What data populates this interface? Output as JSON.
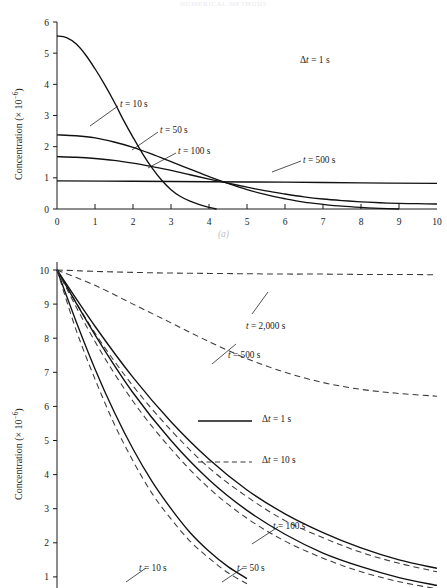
{
  "page": {
    "running_head": "NUMERICAL METHODS"
  },
  "figure": {
    "panel_a_caption": "(a)",
    "panel_b_caption": "(b)"
  },
  "chart_data": [
    {
      "id": "panel-a",
      "type": "line",
      "title": "",
      "xlabel": "",
      "ylabel": "Concentration (× 10",
      "ylabel_exponent": "−6",
      "ylabel_suffix": ")",
      "xlim": [
        0,
        10
      ],
      "ylim": [
        0,
        6
      ],
      "xticks": [
        0,
        1,
        2,
        3,
        4,
        5,
        6,
        7,
        8,
        9,
        10
      ],
      "xtick_labels": [
        "0",
        "1",
        "2",
        "3",
        "4",
        "5",
        "6",
        "7",
        "8",
        "9",
        "10"
      ],
      "yticks": [
        0,
        1,
        2,
        3,
        4,
        5,
        6
      ],
      "ytick_labels": [
        "0",
        "1",
        "2",
        "3",
        "4",
        "5",
        "6"
      ],
      "grid": false,
      "legend_position": "none",
      "annotations": [
        {
          "name": "delta-t-annotation",
          "text_delta": "Δ",
          "text_var": "t",
          "text_rest": " = 1 s"
        }
      ],
      "series": [
        {
          "name": "t = 10 s",
          "label_var": "t",
          "label_rest": " = 10 s",
          "style": "solid",
          "x": [
            0,
            0.25,
            0.5,
            0.75,
            1.0,
            1.25,
            1.5,
            1.75,
            2.0,
            2.25,
            2.5,
            2.75,
            3.0,
            3.25,
            3.5,
            3.75,
            4.0,
            4.2
          ],
          "y": [
            5.55,
            5.5,
            5.3,
            4.95,
            4.5,
            4.0,
            3.45,
            2.85,
            2.3,
            1.78,
            1.32,
            0.93,
            0.62,
            0.4,
            0.25,
            0.14,
            0.05,
            0.0
          ]
        },
        {
          "name": "t = 50 s",
          "label_var": "t",
          "label_rest": " = 50 s",
          "style": "solid",
          "x": [
            0,
            0.5,
            1.0,
            1.5,
            2.0,
            2.5,
            3.0,
            3.5,
            4.0,
            4.5,
            5.0,
            5.5,
            6.0,
            6.5,
            7.0,
            7.5,
            8.0,
            8.5,
            9.0
          ],
          "y": [
            2.38,
            2.35,
            2.28,
            2.15,
            1.98,
            1.76,
            1.52,
            1.28,
            1.04,
            0.82,
            0.62,
            0.46,
            0.33,
            0.22,
            0.15,
            0.09,
            0.05,
            0.02,
            0.0
          ]
        },
        {
          "name": "t = 100 s",
          "label_var": "t",
          "label_rest": " = 100 s",
          "style": "solid",
          "x": [
            0,
            0.5,
            1.0,
            1.5,
            2.0,
            2.5,
            3.0,
            3.5,
            4.0,
            4.5,
            5.0,
            5.5,
            6.0,
            6.5,
            7.0,
            7.5,
            8.0,
            8.5,
            9.0,
            9.5,
            10.0
          ],
          "y": [
            1.68,
            1.66,
            1.62,
            1.56,
            1.47,
            1.36,
            1.24,
            1.1,
            0.96,
            0.83,
            0.7,
            0.58,
            0.48,
            0.39,
            0.32,
            0.27,
            0.23,
            0.2,
            0.18,
            0.17,
            0.16
          ]
        },
        {
          "name": "t = 500 s",
          "label_var": "t",
          "label_rest": " = 500 s",
          "style": "solid",
          "x": [
            0,
            2,
            4,
            6,
            8,
            10
          ],
          "y": [
            0.9,
            0.89,
            0.875,
            0.86,
            0.84,
            0.82
          ]
        }
      ]
    },
    {
      "id": "panel-b",
      "type": "line",
      "title": "",
      "xlabel": "",
      "ylabel": "Concentration (× 10",
      "ylabel_exponent": "−6",
      "ylabel_suffix": ")",
      "xlim": [
        0,
        10
      ],
      "ylim": [
        0,
        10
      ],
      "yticks": [
        1,
        2,
        3,
        4,
        5,
        6,
        7,
        8,
        9,
        10
      ],
      "ytick_labels": [
        "1",
        "2",
        "3",
        "4",
        "5",
        "6",
        "7",
        "8",
        "9",
        "10"
      ],
      "grid": false,
      "legend_position": "center-right",
      "legend": [
        {
          "name": "legend-solid",
          "style": "solid",
          "text_delta": "Δ",
          "text_var": "t",
          "text_rest": " = 1 s"
        },
        {
          "name": "legend-dashed",
          "style": "dashed",
          "text_delta": "Δ",
          "text_var": "t",
          "text_rest": " = 10 s"
        }
      ],
      "series": [
        {
          "name": "t = 2,000 s",
          "label_var": "t",
          "label_rest": " = 2,000 s",
          "style": "dashed",
          "x": [
            0,
            1,
            2,
            3,
            4,
            5,
            6,
            7,
            8,
            9,
            10
          ],
          "y": [
            10.0,
            9.96,
            9.93,
            9.91,
            9.9,
            9.89,
            9.88,
            9.88,
            9.87,
            9.87,
            9.86
          ]
        },
        {
          "name": "t = 500 s",
          "label_var": "t",
          "label_rest": " = 500 s",
          "style": "dashed",
          "x": [
            0,
            1,
            2,
            3,
            4,
            5,
            6,
            7,
            8,
            9,
            10
          ],
          "y": [
            10.0,
            9.55,
            9.0,
            8.45,
            7.9,
            7.4,
            7.0,
            6.7,
            6.5,
            6.38,
            6.3
          ]
        },
        {
          "name": "t = 100 s solid",
          "label_var": "t",
          "label_rest": " = 100 s",
          "style": "solid",
          "x": [
            0,
            1,
            2,
            3,
            4,
            5,
            6,
            7,
            8,
            9,
            10
          ],
          "y": [
            10.0,
            8.35,
            6.85,
            5.55,
            4.45,
            3.55,
            2.85,
            2.3,
            1.85,
            1.5,
            1.25
          ]
        },
        {
          "name": "t = 100 s dashed",
          "style": "dashed",
          "x": [
            0,
            1,
            2,
            3,
            4,
            5,
            6,
            7,
            8,
            9,
            10
          ],
          "y": [
            10.0,
            8.15,
            6.6,
            5.3,
            4.2,
            3.35,
            2.65,
            2.15,
            1.72,
            1.4,
            1.15
          ]
        },
        {
          "name": "t = 50 s solid",
          "label_var": "t",
          "label_rest": " = 50 s",
          "style": "solid",
          "x": [
            0,
            1,
            2,
            3,
            4,
            5,
            6,
            7,
            8,
            9,
            10
          ],
          "y": [
            10.0,
            8.1,
            6.4,
            5.0,
            3.85,
            2.95,
            2.25,
            1.7,
            1.3,
            0.98,
            0.75
          ]
        },
        {
          "name": "t = 50 s dashed",
          "style": "dashed",
          "x": [
            0,
            1,
            2,
            3,
            4,
            5,
            6,
            7,
            8,
            9,
            10
          ],
          "y": [
            10.0,
            7.9,
            6.15,
            4.75,
            3.6,
            2.72,
            2.05,
            1.55,
            1.15,
            0.86,
            0.65
          ]
        },
        {
          "name": "t = 10 s solid",
          "label_var": "t",
          "label_rest": " = 10 s",
          "style": "solid",
          "x": [
            0,
            0.5,
            1.0,
            1.5,
            2.0,
            2.5,
            3.0,
            3.5,
            4.0,
            4.5,
            5.0
          ],
          "y": [
            10.0,
            8.5,
            7.1,
            5.85,
            4.75,
            3.8,
            3.0,
            2.3,
            1.75,
            1.3,
            0.95
          ]
        },
        {
          "name": "t = 10 s dashed",
          "style": "dashed",
          "x": [
            0,
            0.5,
            1.0,
            1.5,
            2.0,
            2.5,
            3.0,
            3.5,
            4.0,
            4.5,
            5.0
          ],
          "y": [
            10.0,
            8.25,
            6.8,
            5.5,
            4.4,
            3.45,
            2.7,
            2.05,
            1.55,
            1.12,
            0.8
          ]
        }
      ]
    }
  ]
}
